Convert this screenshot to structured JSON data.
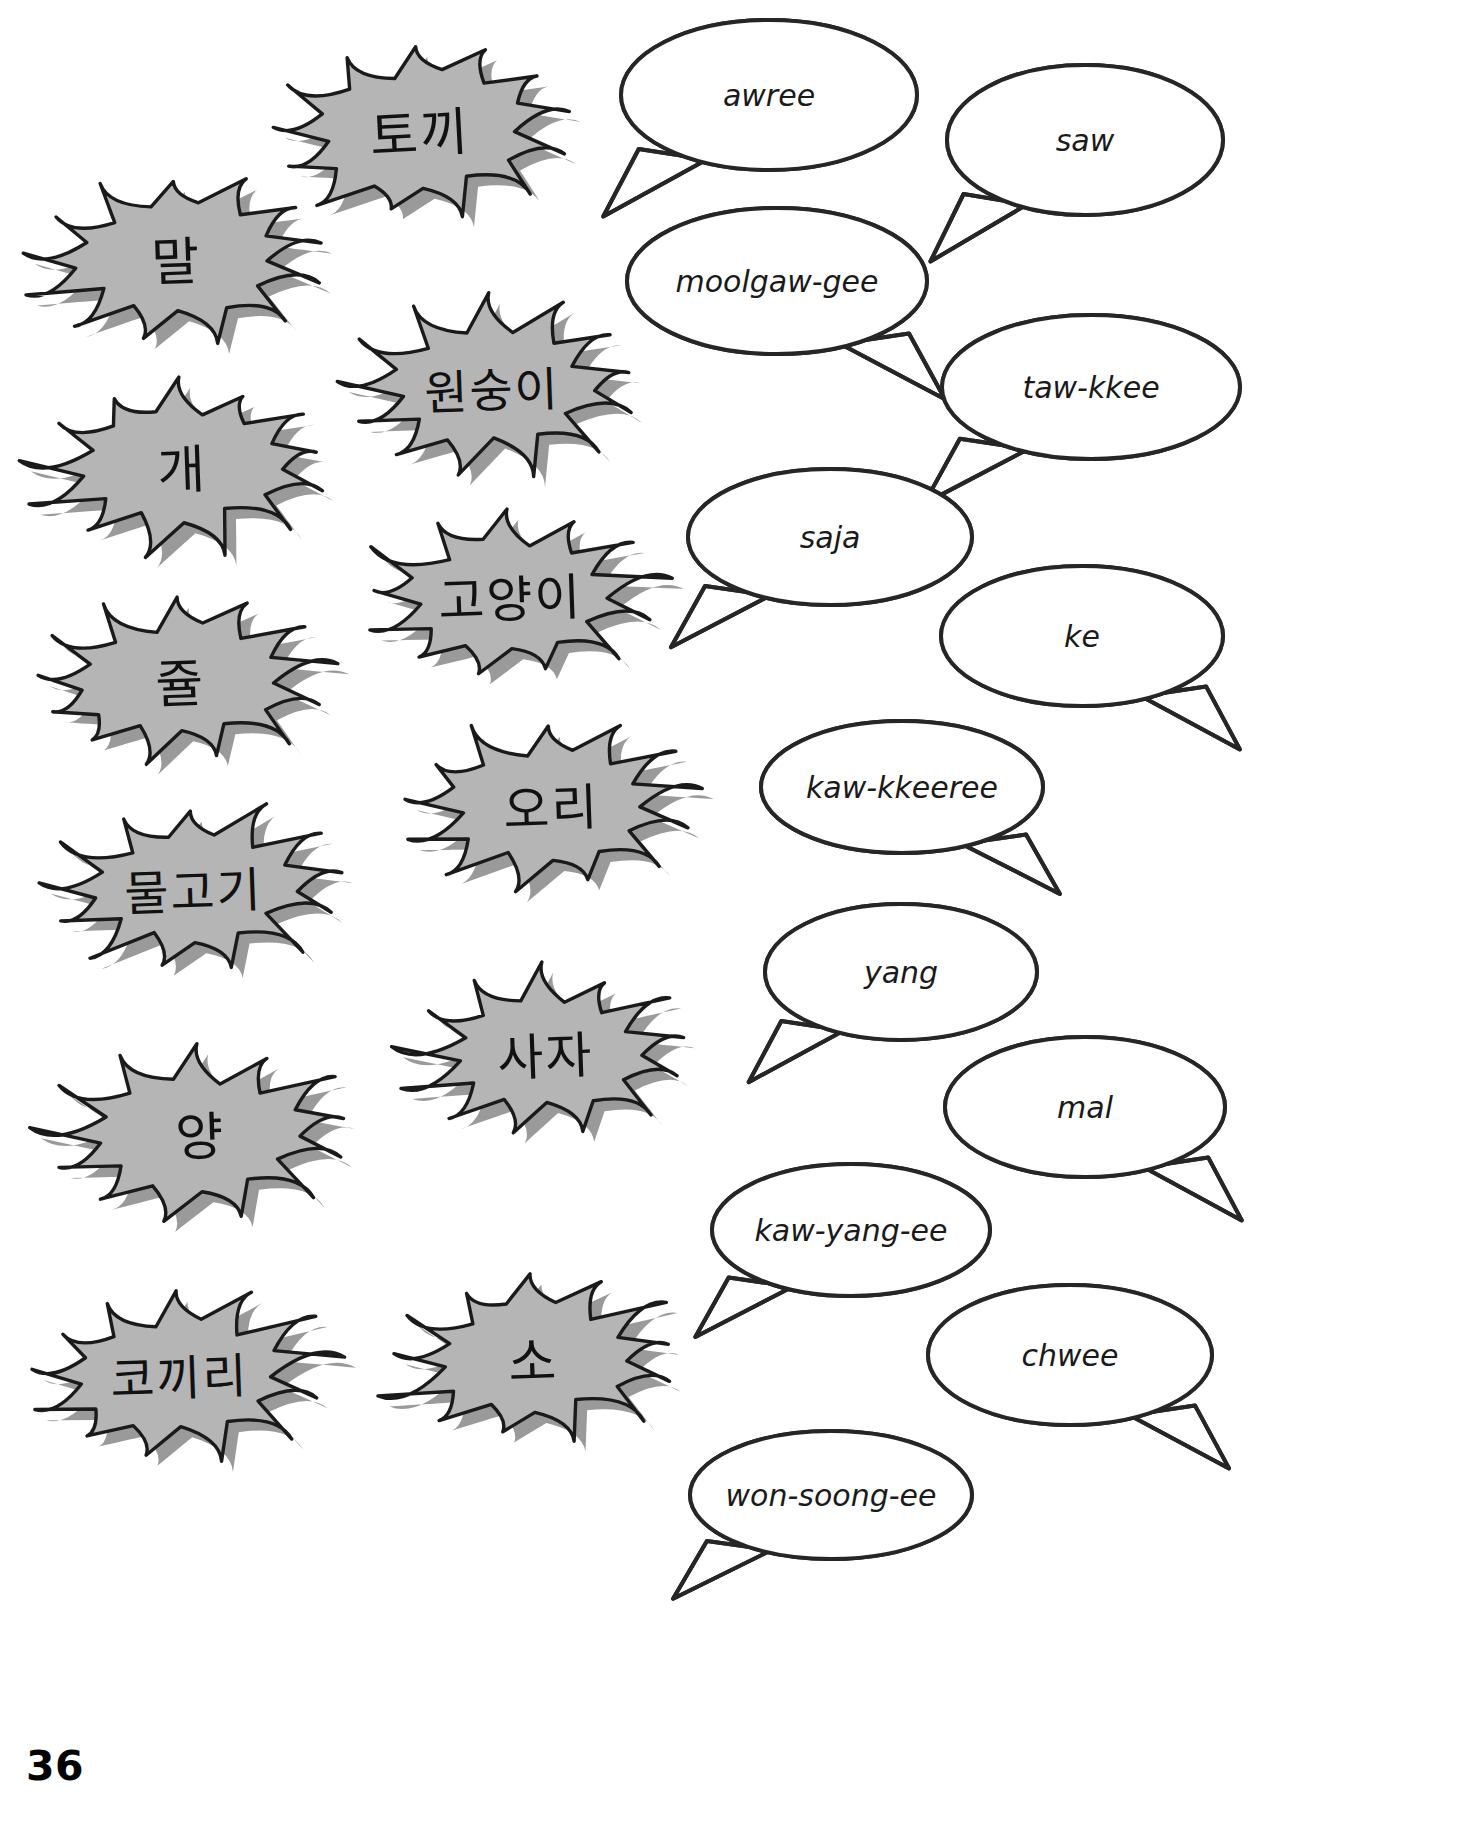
{
  "page": {
    "number": "36",
    "background_color": "#ffffff",
    "burst_fill": "#b5b5b5",
    "burst_stroke": "#1a1a1a",
    "burst_shadow": "#9a9a9a",
    "bubble_fill": "#ffffff",
    "bubble_stroke": "#262626"
  },
  "bursts": [
    {
      "id": "burst-rabbit",
      "text": "토끼",
      "cx": 420,
      "cy": 130,
      "rx": 152,
      "ry": 88,
      "font_size": 52,
      "rot": -3
    },
    {
      "id": "burst-horse",
      "text": "말",
      "cx": 176,
      "cy": 258,
      "rx": 152,
      "ry": 84,
      "font_size": 52,
      "rot": -2
    },
    {
      "id": "burst-monkey",
      "text": "원숭이",
      "cx": 492,
      "cy": 387,
      "rx": 148,
      "ry": 86,
      "font_size": 47,
      "rot": -2
    },
    {
      "id": "burst-dog",
      "text": "개",
      "cx": 182,
      "cy": 466,
      "rx": 150,
      "ry": 84,
      "font_size": 52,
      "rot": -2
    },
    {
      "id": "burst-cat",
      "text": "고양이",
      "cx": 510,
      "cy": 595,
      "rx": 150,
      "ry": 84,
      "font_size": 50,
      "rot": -2
    },
    {
      "id": "burst-mouse",
      "text": "쥴",
      "cx": 180,
      "cy": 680,
      "rx": 150,
      "ry": 84,
      "font_size": 52,
      "rot": -2
    },
    {
      "id": "burst-duck",
      "text": "오리",
      "cx": 551,
      "cy": 804,
      "rx": 148,
      "ry": 82,
      "font_size": 50,
      "rot": -2
    },
    {
      "id": "burst-fish",
      "text": "물고기",
      "cx": 193,
      "cy": 888,
      "rx": 150,
      "ry": 84,
      "font_size": 48,
      "rot": -2
    },
    {
      "id": "burst-lion",
      "text": "사자",
      "cx": 545,
      "cy": 1052,
      "rx": 144,
      "ry": 82,
      "font_size": 50,
      "rot": -2
    },
    {
      "id": "burst-sheep",
      "text": "양",
      "cx": 200,
      "cy": 1133,
      "rx": 154,
      "ry": 84,
      "font_size": 52,
      "rot": -2
    },
    {
      "id": "burst-cow",
      "text": "소",
      "cx": 533,
      "cy": 1358,
      "rx": 150,
      "ry": 82,
      "font_size": 52,
      "rot": -2
    },
    {
      "id": "burst-elephant",
      "text": "코끼리",
      "cx": 179,
      "cy": 1374,
      "rx": 152,
      "ry": 84,
      "font_size": 48,
      "rot": -2
    }
  ],
  "bubbles": [
    {
      "id": "bubble-awree",
      "text": "awree",
      "cx": 769,
      "cy": 95,
      "rx": 148,
      "ry": 75,
      "font_size": 30,
      "tail": "bottom-left"
    },
    {
      "id": "bubble-saw",
      "text": "saw",
      "cx": 1085,
      "cy": 140,
      "rx": 138,
      "ry": 75,
      "font_size": 30,
      "tail": "bottom-left"
    },
    {
      "id": "bubble-moolgaw-gee",
      "text": "moolgaw-gee",
      "cx": 777,
      "cy": 281,
      "rx": 150,
      "ry": 73,
      "font_size": 30,
      "tail": "bottom-right"
    },
    {
      "id": "bubble-taw-kkee",
      "text": "taw-kkee",
      "cx": 1091,
      "cy": 387,
      "rx": 149,
      "ry": 72,
      "font_size": 30,
      "tail": "bottom-left"
    },
    {
      "id": "bubble-saja",
      "text": "saja",
      "cx": 830,
      "cy": 537,
      "rx": 142,
      "ry": 68,
      "font_size": 30,
      "tail": "bottom-left"
    },
    {
      "id": "bubble-ke",
      "text": "ke",
      "cx": 1082,
      "cy": 636,
      "rx": 141,
      "ry": 70,
      "font_size": 30,
      "tail": "bottom-right"
    },
    {
      "id": "bubble-kaw-kkeeree",
      "text": "kaw-kkeeree",
      "cx": 902,
      "cy": 787,
      "rx": 141,
      "ry": 66,
      "font_size": 30,
      "tail": "bottom-right"
    },
    {
      "id": "bubble-yang",
      "text": "yang",
      "cx": 901,
      "cy": 972,
      "rx": 136,
      "ry": 68,
      "font_size": 30,
      "tail": "bottom-left"
    },
    {
      "id": "bubble-mal",
      "text": "mal",
      "cx": 1085,
      "cy": 1107,
      "rx": 140,
      "ry": 70,
      "font_size": 30,
      "tail": "bottom-right"
    },
    {
      "id": "bubble-kaw-yang-ee",
      "text": "kaw-yang-ee",
      "cx": 851,
      "cy": 1230,
      "rx": 139,
      "ry": 66,
      "font_size": 30,
      "tail": "bottom-left"
    },
    {
      "id": "bubble-chwee",
      "text": "chwee",
      "cx": 1070,
      "cy": 1355,
      "rx": 142,
      "ry": 70,
      "font_size": 30,
      "tail": "bottom-right"
    },
    {
      "id": "bubble-won-soong-ee",
      "text": "won-soong-ee",
      "cx": 831,
      "cy": 1495,
      "rx": 141,
      "ry": 64,
      "font_size": 30,
      "tail": "bottom-left"
    }
  ]
}
